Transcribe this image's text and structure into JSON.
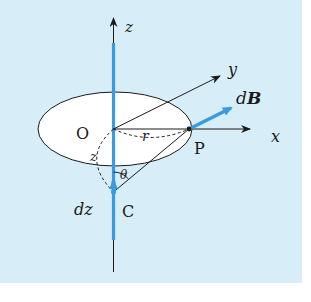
{
  "diagram": {
    "colors": {
      "background": "#d7eef8",
      "page": "#ffffff",
      "current": "#3a9ae0",
      "stroke": "#1a1a1a",
      "disk_fill": "#ffffff"
    },
    "labels": {
      "z_axis": "z",
      "y_axis": "y",
      "x_axis": "x",
      "origin": "O",
      "point_p": "P",
      "point_c": "C",
      "radius": "r",
      "height": "z",
      "angle": "θ",
      "element": "dz",
      "field_d": "d",
      "field_B": "B"
    }
  }
}
